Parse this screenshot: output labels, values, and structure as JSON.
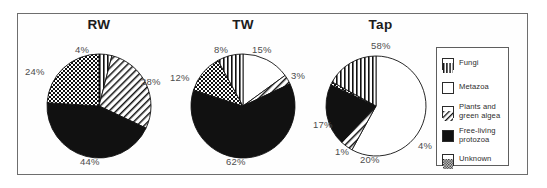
{
  "figure": {
    "accent_color": "#000000",
    "label_color": "#4d4d4d",
    "frame_color": "#6e6e6e"
  },
  "legend": {
    "title": "",
    "items": [
      {
        "label": "Fungi",
        "pattern": "vertical-lines"
      },
      {
        "label": "Metazoa",
        "pattern": "solid-white"
      },
      {
        "label": "Plants and\ngreen algea",
        "label_line1": "Plants and",
        "label_line2": "green algea",
        "pattern": "diagonal-hatch"
      },
      {
        "label": "Free-living\nprotozoa",
        "label_line1": "Free-living",
        "label_line2": "protozoa",
        "pattern": "solid-black"
      },
      {
        "label": "Unknown",
        "pattern": "checkerboard"
      }
    ]
  },
  "chart_data": [
    {
      "type": "pie",
      "title": "RW",
      "categories": [
        "Fungi",
        "Plants and green algea",
        "Free-living protozoa",
        "Unknown"
      ],
      "values": [
        4,
        28,
        44,
        24
      ],
      "labels": [
        "4%",
        "28%",
        "44%",
        "24%"
      ],
      "patterns": [
        "vertical-lines",
        "diagonal-hatch",
        "solid-black",
        "checkerboard"
      ],
      "start_angle": 0,
      "legend": "shared"
    },
    {
      "type": "pie",
      "title": "TW",
      "categories": [
        "Metazoa",
        "Plants and green algea",
        "Free-living protozoa",
        "Unknown",
        "Fungi"
      ],
      "values": [
        15,
        3,
        62,
        12,
        8
      ],
      "labels": [
        "15%",
        "3%",
        "62%",
        "12%",
        "8%"
      ],
      "patterns": [
        "solid-white",
        "diagonal-hatch",
        "solid-black",
        "checkerboard",
        "vertical-lines"
      ],
      "start_angle": 0,
      "legend": "shared"
    },
    {
      "type": "pie",
      "title": "Tap",
      "categories": [
        "Metazoa",
        "Plants and green algea",
        "Free-living protozoa",
        "Unknown",
        "Fungi"
      ],
      "values": [
        58,
        4,
        20,
        1,
        17
      ],
      "labels": [
        "58%",
        "4%",
        "20%",
        "1%",
        "17%"
      ],
      "patterns": [
        "solid-white",
        "diagonal-hatch",
        "solid-black",
        "checkerboard",
        "vertical-lines"
      ],
      "start_angle": 0,
      "legend": "shared"
    }
  ]
}
